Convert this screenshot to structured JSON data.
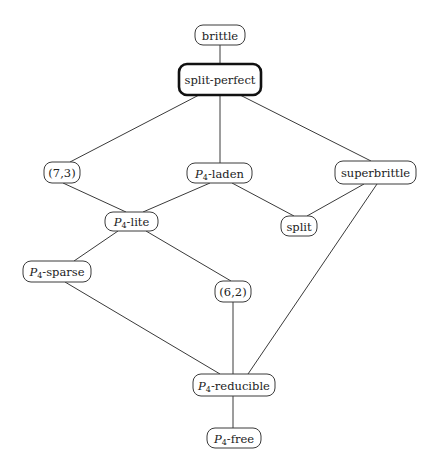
{
  "diagram": {
    "type": "hasse-diagram",
    "nodes": [
      {
        "id": "brittle",
        "label": "brittle",
        "x": 195,
        "y": 25,
        "w": 50,
        "h": 20,
        "bold": false
      },
      {
        "id": "split-perfect",
        "label": "split-perfect",
        "x": 179,
        "y": 64,
        "w": 82,
        "h": 31,
        "bold": true
      },
      {
        "id": "7-3",
        "label": "(7,3)",
        "x": 44,
        "y": 162,
        "w": 36,
        "h": 21,
        "bold": false
      },
      {
        "id": "p4-laden",
        "prefix": "P",
        "sub": "4",
        "suffix": "-laden",
        "label": "P4-laden",
        "x": 187,
        "y": 163,
        "w": 65,
        "h": 20,
        "bold": false
      },
      {
        "id": "superbrittle",
        "label": "superbrittle",
        "x": 335,
        "y": 161,
        "w": 81,
        "h": 23,
        "bold": false
      },
      {
        "id": "p4-lite",
        "prefix": "P",
        "sub": "4",
        "suffix": "-lite",
        "label": "P4-lite",
        "x": 105,
        "y": 212,
        "w": 53,
        "h": 19,
        "bold": false
      },
      {
        "id": "split",
        "label": "split",
        "x": 281,
        "y": 216,
        "w": 36,
        "h": 20,
        "bold": false
      },
      {
        "id": "p4-sparse",
        "prefix": "P",
        "sub": "4",
        "suffix": "-sparse",
        "label": "P4-sparse",
        "x": 23,
        "y": 261,
        "w": 68,
        "h": 21,
        "bold": false
      },
      {
        "id": "6-2",
        "label": "(6,2)",
        "x": 215,
        "y": 281,
        "w": 36,
        "h": 21,
        "bold": false
      },
      {
        "id": "p4-reducible",
        "prefix": "P",
        "sub": "4",
        "suffix": "-reducible",
        "label": "P4-reducible",
        "x": 193,
        "y": 374,
        "w": 82,
        "h": 22,
        "bold": false
      },
      {
        "id": "p4-free",
        "prefix": "P",
        "sub": "4",
        "suffix": "-free",
        "label": "P4-free",
        "x": 207,
        "y": 428,
        "w": 54,
        "h": 20,
        "bold": false
      }
    ],
    "edges": [
      {
        "from": "brittle",
        "to": "split-perfect",
        "x1": 220,
        "y1": 45,
        "x2": 220,
        "y2": 64
      },
      {
        "from": "split-perfect",
        "to": "7-3",
        "x1": 199,
        "y1": 95,
        "x2": 70,
        "y2": 162
      },
      {
        "from": "split-perfect",
        "to": "p4-laden",
        "x1": 220,
        "y1": 95,
        "x2": 220,
        "y2": 163
      },
      {
        "from": "split-perfect",
        "to": "superbrittle",
        "x1": 240,
        "y1": 95,
        "x2": 371,
        "y2": 161
      },
      {
        "from": "7-3",
        "to": "p4-lite",
        "x1": 63,
        "y1": 183,
        "x2": 126,
        "y2": 212
      },
      {
        "from": "p4-laden",
        "to": "p4-lite",
        "x1": 210,
        "y1": 183,
        "x2": 143,
        "y2": 212
      },
      {
        "from": "p4-laden",
        "to": "split",
        "x1": 232,
        "y1": 183,
        "x2": 294,
        "y2": 216
      },
      {
        "from": "superbrittle",
        "to": "split",
        "x1": 364,
        "y1": 184,
        "x2": 307,
        "y2": 216
      },
      {
        "from": "superbrittle",
        "to": "p4-reducible",
        "x1": 377,
        "y1": 184,
        "x2": 248,
        "y2": 374
      },
      {
        "from": "p4-lite",
        "to": "p4-sparse",
        "x1": 118,
        "y1": 231,
        "x2": 74,
        "y2": 261
      },
      {
        "from": "p4-lite",
        "to": "6-2",
        "x1": 146,
        "y1": 231,
        "x2": 231,
        "y2": 281
      },
      {
        "from": "p4-sparse",
        "to": "p4-reducible",
        "x1": 65,
        "y1": 282,
        "x2": 220,
        "y2": 374
      },
      {
        "from": "6-2",
        "to": "p4-reducible",
        "x1": 233,
        "y1": 302,
        "x2": 233,
        "y2": 374
      },
      {
        "from": "p4-reducible",
        "to": "p4-free",
        "x1": 233,
        "y1": 396,
        "x2": 233,
        "y2": 428
      }
    ]
  },
  "colors": {
    "line": "#3a3a3a",
    "text": "#222222",
    "background": "#ffffff"
  }
}
